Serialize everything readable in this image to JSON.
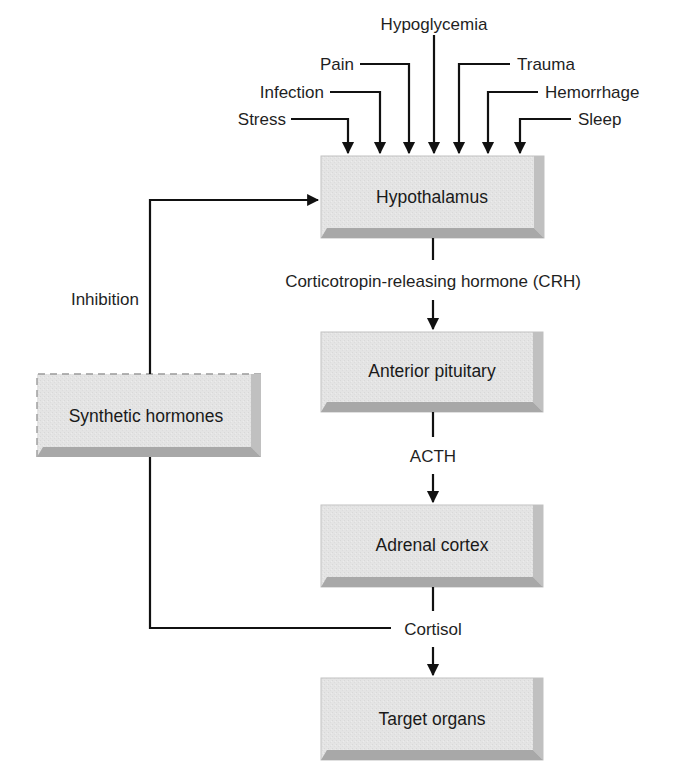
{
  "colors": {
    "box_face": "#e6e6e6",
    "box_bevel_dark": "#a9a9a9",
    "box_bevel_mid": "#c4c4c4",
    "box_edge": "#bdbdbd",
    "line": "#111111"
  },
  "stimuli": [
    "Stress",
    "Infection",
    "Pain",
    "Hypoglycemia",
    "Trauma",
    "Hemorrhage",
    "Sleep"
  ],
  "boxes": {
    "hypothalamus": "Hypothalamus",
    "anterior_pituitary": "Anterior pituitary",
    "adrenal_cortex": "Adrenal cortex",
    "target_organs": "Target organs",
    "synthetic_hormones": "Synthetic hormones"
  },
  "edge_labels": {
    "crh": "Corticotropin-releasing hormone (CRH)",
    "acth": "ACTH",
    "cortisol": "Cortisol",
    "inhibition": "Inhibition"
  }
}
